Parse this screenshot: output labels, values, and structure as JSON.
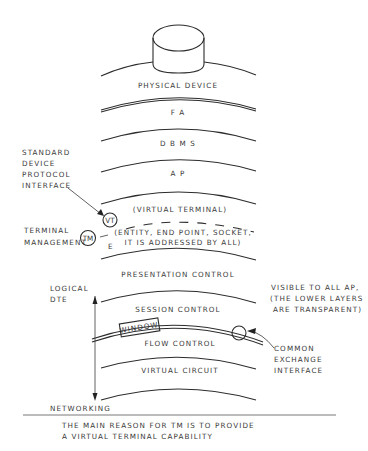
{
  "diagram": {
    "device": {
      "label": "PHYSICAL DEVICE",
      "icon": "cylinder-device-icon"
    },
    "layers": [
      {
        "id": "physical-device",
        "label": "PHYSICAL DEVICE"
      },
      {
        "id": "fa",
        "label": "F A"
      },
      {
        "id": "dbms",
        "label": "D B M S"
      },
      {
        "id": "ap",
        "label": "A P"
      },
      {
        "id": "virtual-terminal",
        "label": "(VIRTUAL TERMINAL)"
      },
      {
        "id": "entity",
        "label_line1": "(ENTITY, END POINT, SOCKET,",
        "label_line2": "IT IS ADDRESSED BY ALL)"
      },
      {
        "id": "presentation-control",
        "label": "PRESENTATION CONTROL"
      },
      {
        "id": "session-control",
        "label": "SESSION CONTROL"
      },
      {
        "id": "flow-control",
        "label": "FLOW CONTROL"
      },
      {
        "id": "virtual-circuit",
        "label": "VIRTUAL CIRCUIT"
      }
    ],
    "annotations": {
      "standard_device": [
        "STANDARD",
        "DEVICE",
        "PROTOCOL",
        "INTERFACE"
      ],
      "vt_circle": "VT",
      "terminal_management": [
        "TERMINAL",
        "MANAGEMENT"
      ],
      "tm_circle": "TM",
      "e_label": "E",
      "logical_dte": [
        "LOGICAL",
        "DTE"
      ],
      "window_box": "WINDOW",
      "visible_note": [
        "VISIBLE TO ALL AP,",
        "(THE LOWER LAYERS",
        "ARE TRANSPARENT)"
      ],
      "common_exchange": [
        "COMMON",
        "EXCHANGE",
        "INTERFACE"
      ],
      "networking": "NETWORKING"
    },
    "caption": {
      "line1": "THE MAIN REASON FOR TM IS TO PROVIDE",
      "line2": "A VIRTUAL TERMINAL CAPABILITY"
    }
  }
}
